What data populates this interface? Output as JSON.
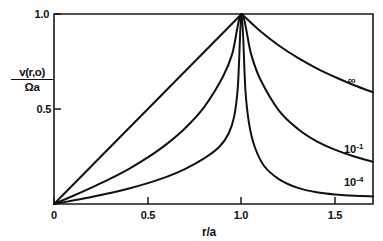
{
  "chart_data": {
    "type": "line",
    "title": "",
    "subtitle": "",
    "xlabel": "r/a",
    "ylabel_numerator": "v(r,o)",
    "ylabel_denominator": "Ωa",
    "ylabel": "v(r,o)/Ωa",
    "xlim": [
      0,
      1.7
    ],
    "ylim": [
      0,
      1.0
    ],
    "xticks": [
      0,
      0.5,
      1.0,
      1.5
    ],
    "xticklabels": [
      "0",
      "0.5",
      "1.0",
      "1.5"
    ],
    "yticks": [
      0.5,
      1.0
    ],
    "yticklabels": [
      "0.5",
      "1.0"
    ],
    "grid": false,
    "legend_position": "inline-right-of-curve",
    "line_color": "#111111",
    "frame_color": "#1a1a1a",
    "background_color": "#ffffff",
    "series": [
      {
        "name": "∞",
        "label": "∞",
        "label_base": "∞",
        "label_exponent": "",
        "x": [
          0,
          0.1,
          0.2,
          0.3,
          0.4,
          0.5,
          0.6,
          0.7,
          0.8,
          0.9,
          1.0,
          1.1,
          1.2,
          1.3,
          1.4,
          1.5,
          1.6,
          1.7
        ],
        "values": [
          0,
          0.1,
          0.2,
          0.3,
          0.4,
          0.5,
          0.6,
          0.7,
          0.8,
          0.9,
          1.0,
          0.909,
          0.833,
          0.769,
          0.714,
          0.667,
          0.625,
          0.588
        ]
      },
      {
        "name": "10⁻¹",
        "label": "10⁻¹",
        "label_base": "10",
        "label_exponent": "-1",
        "x": [
          0,
          0.1,
          0.2,
          0.3,
          0.4,
          0.5,
          0.6,
          0.7,
          0.8,
          0.9,
          0.95,
          1.0,
          1.05,
          1.1,
          1.2,
          1.3,
          1.4,
          1.5,
          1.6,
          1.7
        ],
        "values": [
          0,
          0.042,
          0.086,
          0.133,
          0.185,
          0.245,
          0.315,
          0.4,
          0.51,
          0.67,
          0.79,
          1.0,
          0.79,
          0.655,
          0.49,
          0.395,
          0.33,
          0.285,
          0.25,
          0.222
        ]
      },
      {
        "name": "10⁻⁴",
        "label": "10⁻⁴",
        "label_base": "10",
        "label_exponent": "-4",
        "x": [
          0,
          0.1,
          0.2,
          0.3,
          0.4,
          0.5,
          0.6,
          0.7,
          0.8,
          0.88,
          0.93,
          0.96,
          0.98,
          1.0,
          1.02,
          1.04,
          1.07,
          1.12,
          1.2,
          1.3,
          1.4,
          1.5,
          1.6,
          1.7
        ],
        "values": [
          0,
          0.018,
          0.037,
          0.058,
          0.082,
          0.11,
          0.143,
          0.185,
          0.24,
          0.3,
          0.37,
          0.46,
          0.62,
          1.0,
          0.6,
          0.42,
          0.3,
          0.2,
          0.13,
          0.085,
          0.062,
          0.05,
          0.043,
          0.04
        ]
      }
    ],
    "annotations": [
      {
        "text": "∞",
        "x": 1.53,
        "y": 0.62
      },
      {
        "text": "10⁻¹",
        "x": 1.5,
        "y": 0.275
      },
      {
        "text": "10⁻⁴",
        "x": 1.5,
        "y": 0.105
      }
    ]
  }
}
